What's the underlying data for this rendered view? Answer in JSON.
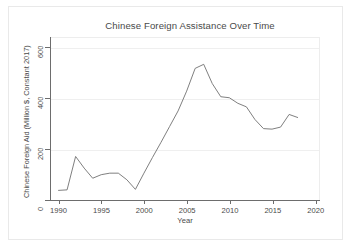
{
  "chart_data": {
    "type": "line",
    "title": "Chinese Foreign Assistance Over Time",
    "xlabel": "Year",
    "ylabel": "Chinese Foreign Aid (Million $, Constant 2017)",
    "xlim": [
      1989,
      2020.5
    ],
    "ylim": [
      0,
      640
    ],
    "xticks": [
      1990,
      1995,
      2000,
      2005,
      2010,
      2015,
      2020
    ],
    "xtick_labels": [
      "1990",
      "1995",
      "2000",
      "2005",
      "2010",
      "2015",
      "2020"
    ],
    "yticks": [
      0,
      200,
      400,
      600
    ],
    "ytick_labels": [
      "0",
      "200",
      "400",
      "600"
    ],
    "grid": "horizontal",
    "legend": "none",
    "line_color": "#707070",
    "background_color": "#ffffff",
    "axis_color": "#6d6d6d",
    "x": [
      1990,
      1991,
      1992,
      1993,
      1994,
      1995,
      1996,
      1997,
      1998,
      1999,
      2000,
      2001,
      2002,
      2003,
      2004,
      2005,
      2006,
      2007,
      2008,
      2009,
      2010,
      2011,
      2012,
      2013,
      2014,
      2015,
      2016,
      2017,
      2018
    ],
    "values": [
      38,
      40,
      172,
      126,
      86,
      100,
      106,
      106,
      80,
      42,
      106,
      168,
      228,
      290,
      352,
      430,
      520,
      536,
      460,
      408,
      404,
      382,
      368,
      318,
      282,
      280,
      288,
      338,
      326
    ],
    "series": [
      {
        "name": "Chinese Foreign Aid",
        "values": [
          38,
          40,
          172,
          126,
          86,
          100,
          106,
          106,
          80,
          42,
          106,
          168,
          228,
          290,
          352,
          430,
          520,
          536,
          460,
          408,
          404,
          382,
          368,
          318,
          282,
          280,
          288,
          338,
          326
        ]
      }
    ]
  }
}
